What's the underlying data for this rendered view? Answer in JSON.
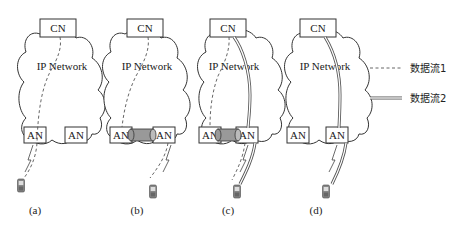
{
  "panels": [
    {
      "id": "a",
      "caption": "(a)",
      "cn": "CN",
      "network": "IP Network",
      "an_left": "AN",
      "an_right": "AN",
      "tunnel": false,
      "flow1": true,
      "flow2": false
    },
    {
      "id": "b",
      "caption": "(b)",
      "cn": "CN",
      "network": "IP Network",
      "an_left": "AN",
      "an_right": "AN",
      "tunnel": true,
      "flow1": true,
      "flow2": false
    },
    {
      "id": "c",
      "caption": "(c)",
      "cn": "CN",
      "network": "IP Network",
      "an_left": "AN",
      "an_right": "AN",
      "tunnel": true,
      "flow1": true,
      "flow2": true
    },
    {
      "id": "d",
      "caption": "(d)",
      "cn": "CN",
      "network": "IP Network",
      "an_left": "AN",
      "an_right": "AN",
      "tunnel": false,
      "flow1": false,
      "flow2": true
    }
  ],
  "legend": {
    "flow1": {
      "label": "数据流1",
      "style": "dashed"
    },
    "flow2": {
      "label": "数据流2",
      "style": "double-line"
    }
  },
  "colors": {
    "line": "#333333",
    "tunnel": "#999999",
    "background": "#ffffff"
  }
}
